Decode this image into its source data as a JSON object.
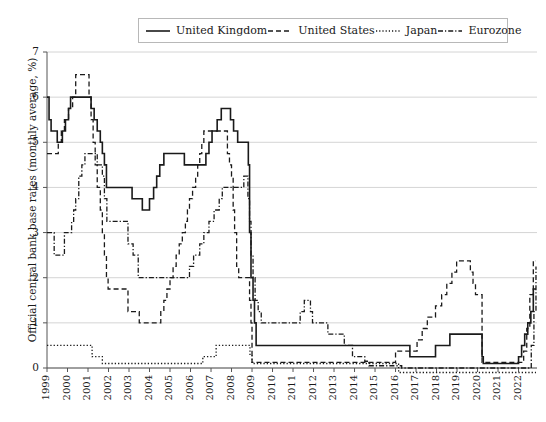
{
  "chart_data": {
    "type": "line",
    "title": "",
    "xlabel": "",
    "ylabel": "Official central bank base rates (monthly average, %)",
    "ylim": [
      0,
      7
    ],
    "xlim": [
      1999,
      2022.9
    ],
    "yticks": [
      0,
      1,
      2,
      3,
      4,
      5,
      6,
      7
    ],
    "ytick_labels": [
      "0",
      "1",
      "2",
      "3",
      "4",
      "5",
      "6",
      "7"
    ],
    "xticks": [
      1999,
      2000,
      2001,
      2002,
      2003,
      2004,
      2005,
      2006,
      2007,
      2008,
      2009,
      2010,
      2011,
      2012,
      2013,
      2014,
      2015,
      2016,
      2017,
      2018,
      2019,
      2020,
      2021,
      2022
    ],
    "xtick_labels": [
      "1999",
      "2000",
      "2001",
      "2002",
      "2003",
      "2004",
      "2005",
      "2006",
      "2007",
      "2008",
      "2009",
      "2010",
      "2011",
      "2012",
      "2013",
      "2014",
      "2015",
      "2016",
      "2017",
      "2018",
      "2019",
      "2020",
      "2021",
      "2022"
    ],
    "grid": "horizontal",
    "legend_position": "top-center",
    "series": [
      {
        "name": "United Kingdom",
        "style": "solid",
        "color": "#1a1a1a",
        "points": [
          [
            1999.0,
            6.0
          ],
          [
            1999.1,
            5.5
          ],
          [
            1999.2,
            5.25
          ],
          [
            1999.35,
            5.25
          ],
          [
            1999.5,
            5.0
          ],
          [
            1999.65,
            5.0
          ],
          [
            1999.75,
            5.25
          ],
          [
            1999.9,
            5.5
          ],
          [
            2000.05,
            5.75
          ],
          [
            2000.15,
            6.0
          ],
          [
            2000.5,
            6.0
          ],
          [
            2001.0,
            6.0
          ],
          [
            2001.15,
            5.75
          ],
          [
            2001.3,
            5.5
          ],
          [
            2001.45,
            5.25
          ],
          [
            2001.6,
            5.0
          ],
          [
            2001.7,
            4.75
          ],
          [
            2001.8,
            4.5
          ],
          [
            2001.9,
            4.0
          ],
          [
            2002.0,
            4.0
          ],
          [
            2003.0,
            4.0
          ],
          [
            2003.15,
            3.75
          ],
          [
            2003.55,
            3.75
          ],
          [
            2003.65,
            3.5
          ],
          [
            2003.85,
            3.5
          ],
          [
            2004.0,
            3.75
          ],
          [
            2004.2,
            4.0
          ],
          [
            2004.35,
            4.25
          ],
          [
            2004.5,
            4.5
          ],
          [
            2004.7,
            4.75
          ],
          [
            2005.55,
            4.75
          ],
          [
            2005.7,
            4.5
          ],
          [
            2006.6,
            4.5
          ],
          [
            2006.75,
            4.75
          ],
          [
            2006.9,
            5.0
          ],
          [
            2007.05,
            5.25
          ],
          [
            2007.3,
            5.5
          ],
          [
            2007.5,
            5.75
          ],
          [
            2007.85,
            5.75
          ],
          [
            2007.95,
            5.5
          ],
          [
            2008.1,
            5.25
          ],
          [
            2008.3,
            5.0
          ],
          [
            2008.75,
            5.0
          ],
          [
            2008.82,
            4.5
          ],
          [
            2008.88,
            3.0
          ],
          [
            2008.95,
            2.0
          ],
          [
            2009.05,
            1.5
          ],
          [
            2009.12,
            1.0
          ],
          [
            2009.2,
            0.5
          ],
          [
            2016.6,
            0.5
          ],
          [
            2016.7,
            0.25
          ],
          [
            2017.85,
            0.25
          ],
          [
            2017.95,
            0.5
          ],
          [
            2018.55,
            0.5
          ],
          [
            2018.65,
            0.75
          ],
          [
            2020.15,
            0.75
          ],
          [
            2020.22,
            0.25
          ],
          [
            2020.28,
            0.1
          ],
          [
            2021.9,
            0.1
          ],
          [
            2022.0,
            0.25
          ],
          [
            2022.15,
            0.5
          ],
          [
            2022.3,
            0.75
          ],
          [
            2022.45,
            1.0
          ],
          [
            2022.6,
            1.25
          ],
          [
            2022.72,
            1.75
          ],
          [
            2022.85,
            1.75
          ]
        ]
      },
      {
        "name": "United States",
        "style": "dashed",
        "color": "#1a1a1a",
        "points": [
          [
            1999.0,
            4.75
          ],
          [
            1999.45,
            4.75
          ],
          [
            1999.55,
            5.0
          ],
          [
            1999.7,
            5.25
          ],
          [
            1999.85,
            5.5
          ],
          [
            2000.05,
            5.75
          ],
          [
            2000.25,
            6.0
          ],
          [
            2000.4,
            6.5
          ],
          [
            2000.95,
            6.5
          ],
          [
            2001.05,
            6.0
          ],
          [
            2001.15,
            5.5
          ],
          [
            2001.25,
            5.0
          ],
          [
            2001.35,
            4.5
          ],
          [
            2001.45,
            4.0
          ],
          [
            2001.6,
            3.5
          ],
          [
            2001.7,
            3.0
          ],
          [
            2001.8,
            2.5
          ],
          [
            2001.9,
            2.0
          ],
          [
            2001.98,
            1.75
          ],
          [
            2002.85,
            1.75
          ],
          [
            2002.95,
            1.25
          ],
          [
            2003.4,
            1.25
          ],
          [
            2003.5,
            1.0
          ],
          [
            2004.45,
            1.0
          ],
          [
            2004.55,
            1.25
          ],
          [
            2004.7,
            1.5
          ],
          [
            2004.85,
            1.75
          ],
          [
            2005.0,
            2.0
          ],
          [
            2005.15,
            2.25
          ],
          [
            2005.3,
            2.5
          ],
          [
            2005.45,
            2.75
          ],
          [
            2005.6,
            3.0
          ],
          [
            2005.75,
            3.25
          ],
          [
            2005.85,
            3.5
          ],
          [
            2005.95,
            3.75
          ],
          [
            2006.1,
            4.0
          ],
          [
            2006.25,
            4.25
          ],
          [
            2006.35,
            4.5
          ],
          [
            2006.45,
            4.75
          ],
          [
            2006.55,
            5.0
          ],
          [
            2006.65,
            5.25
          ],
          [
            2007.7,
            5.25
          ],
          [
            2007.8,
            4.75
          ],
          [
            2007.9,
            4.5
          ],
          [
            2008.0,
            4.25
          ],
          [
            2008.08,
            3.5
          ],
          [
            2008.15,
            3.0
          ],
          [
            2008.25,
            2.25
          ],
          [
            2008.35,
            2.0
          ],
          [
            2008.8,
            2.0
          ],
          [
            2008.88,
            1.5
          ],
          [
            2008.95,
            1.0
          ],
          [
            2009.0,
            0.125
          ],
          [
            2015.9,
            0.125
          ],
          [
            2016.0,
            0.375
          ],
          [
            2016.95,
            0.375
          ],
          [
            2017.05,
            0.625
          ],
          [
            2017.3,
            0.875
          ],
          [
            2017.55,
            1.125
          ],
          [
            2017.95,
            1.375
          ],
          [
            2018.25,
            1.625
          ],
          [
            2018.5,
            1.875
          ],
          [
            2018.75,
            2.125
          ],
          [
            2018.98,
            2.375
          ],
          [
            2019.55,
            2.375
          ],
          [
            2019.65,
            2.125
          ],
          [
            2019.78,
            1.875
          ],
          [
            2019.9,
            1.625
          ],
          [
            2020.15,
            1.625
          ],
          [
            2020.22,
            0.125
          ],
          [
            2022.15,
            0.125
          ],
          [
            2022.25,
            0.375
          ],
          [
            2022.4,
            0.875
          ],
          [
            2022.55,
            1.625
          ],
          [
            2022.72,
            2.375
          ],
          [
            2022.85,
            2.375
          ]
        ]
      },
      {
        "name": "Japan",
        "style": "dotted",
        "color": "#1a1a1a",
        "points": [
          [
            1999.0,
            0.5
          ],
          [
            1999.1,
            0.5
          ],
          [
            2001.1,
            0.5
          ],
          [
            2001.2,
            0.25
          ],
          [
            2001.6,
            0.25
          ],
          [
            2001.7,
            0.1
          ],
          [
            2006.5,
            0.1
          ],
          [
            2006.6,
            0.25
          ],
          [
            2007.15,
            0.25
          ],
          [
            2007.25,
            0.5
          ],
          [
            2008.8,
            0.5
          ],
          [
            2008.9,
            0.3
          ],
          [
            2009.0,
            0.1
          ],
          [
            2016.05,
            0.1
          ],
          [
            2016.15,
            -0.1
          ],
          [
            2022.85,
            -0.1
          ]
        ]
      },
      {
        "name": "Eurozone",
        "style": "dashdot",
        "color": "#1a1a1a",
        "points": [
          [
            1999.0,
            3.0
          ],
          [
            1999.25,
            3.0
          ],
          [
            1999.35,
            2.5
          ],
          [
            1999.75,
            2.5
          ],
          [
            1999.85,
            3.0
          ],
          [
            2000.1,
            3.0
          ],
          [
            2000.2,
            3.25
          ],
          [
            2000.3,
            3.5
          ],
          [
            2000.4,
            3.75
          ],
          [
            2000.55,
            4.25
          ],
          [
            2000.7,
            4.5
          ],
          [
            2000.85,
            4.75
          ],
          [
            2001.35,
            4.75
          ],
          [
            2001.45,
            4.5
          ],
          [
            2001.7,
            4.25
          ],
          [
            2001.8,
            3.75
          ],
          [
            2001.92,
            3.25
          ],
          [
            2002.85,
            3.25
          ],
          [
            2002.95,
            2.75
          ],
          [
            2003.2,
            2.5
          ],
          [
            2003.45,
            2.0
          ],
          [
            2005.85,
            2.0
          ],
          [
            2005.95,
            2.25
          ],
          [
            2006.15,
            2.5
          ],
          [
            2006.45,
            2.75
          ],
          [
            2006.65,
            3.0
          ],
          [
            2006.9,
            3.25
          ],
          [
            2007.15,
            3.5
          ],
          [
            2007.4,
            3.75
          ],
          [
            2007.55,
            4.0
          ],
          [
            2008.5,
            4.0
          ],
          [
            2008.6,
            4.25
          ],
          [
            2008.8,
            3.75
          ],
          [
            2008.88,
            3.25
          ],
          [
            2008.95,
            2.5
          ],
          [
            2009.05,
            2.0
          ],
          [
            2009.15,
            1.5
          ],
          [
            2009.3,
            1.25
          ],
          [
            2009.45,
            1.0
          ],
          [
            2011.25,
            1.0
          ],
          [
            2011.35,
            1.25
          ],
          [
            2011.55,
            1.5
          ],
          [
            2011.85,
            1.25
          ],
          [
            2011.95,
            1.0
          ],
          [
            2012.6,
            1.0
          ],
          [
            2012.7,
            0.75
          ],
          [
            2013.4,
            0.75
          ],
          [
            2013.5,
            0.5
          ],
          [
            2013.9,
            0.25
          ],
          [
            2014.5,
            0.15
          ],
          [
            2014.7,
            0.05
          ],
          [
            2016.2,
            0.05
          ],
          [
            2016.3,
            0.0
          ],
          [
            2022.5,
            0.0
          ],
          [
            2022.62,
            0.5
          ],
          [
            2022.75,
            1.25
          ],
          [
            2022.85,
            2.25
          ]
        ]
      }
    ]
  },
  "legend": {
    "items": [
      {
        "label": "United Kingdom",
        "swatch": "solid-line-swatch"
      },
      {
        "label": "United States",
        "swatch": "dashed-line-swatch"
      },
      {
        "label": "Japan",
        "swatch": "dotted-line-swatch"
      },
      {
        "label": "Eurozone",
        "swatch": "dashdot-line-swatch"
      }
    ]
  },
  "axes": {
    "y_title": "Official central bank base rates (monthly average, %)"
  }
}
